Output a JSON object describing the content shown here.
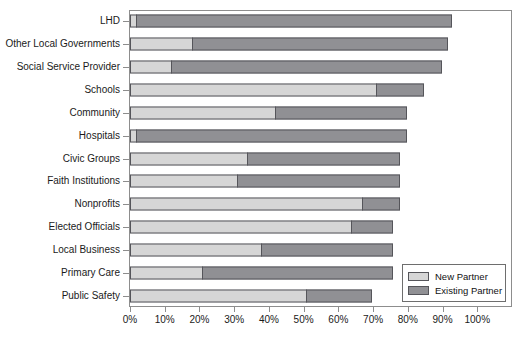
{
  "chart_data": {
    "type": "bar",
    "orientation": "horizontal",
    "stacked": true,
    "title": "",
    "xlabel": "",
    "ylabel": "",
    "xlim": [
      0,
      110
    ],
    "grid": false,
    "legend_position": "bottom-right",
    "categories": [
      "LHD",
      "Other Local Governments",
      "Social Service Provider",
      "Schools",
      "Community",
      "Hospitals",
      "Civic Groups",
      "Faith Institutions",
      "Nonprofits",
      "Elected Officials",
      "Local Business",
      "Primary Care",
      "Public Safety"
    ],
    "series": [
      {
        "name": "New Partner",
        "color": "#d6d6d6",
        "values": [
          2,
          18,
          12,
          71,
          42,
          2,
          34,
          31,
          67,
          64,
          38,
          21,
          51
        ]
      },
      {
        "name": "Existing Partner",
        "color": "#909094",
        "values": [
          91,
          74,
          78,
          14,
          38,
          78,
          44,
          47,
          11,
          12,
          38,
          55,
          19
        ]
      }
    ],
    "totals": [
      93,
      92,
      90,
      85,
      80,
      80,
      78,
      78,
      78,
      76,
      76,
      76,
      70
    ],
    "xticks": [
      0,
      10,
      20,
      30,
      40,
      50,
      60,
      70,
      80,
      90,
      100
    ],
    "xticklabels": [
      "0%",
      "10%",
      "20%",
      "30%",
      "40%",
      "50%",
      "60%",
      "70%",
      "80%",
      "90%",
      "100%"
    ]
  },
  "legend": {
    "items": [
      {
        "label": "New Partner"
      },
      {
        "label": "Existing Partner"
      }
    ]
  }
}
